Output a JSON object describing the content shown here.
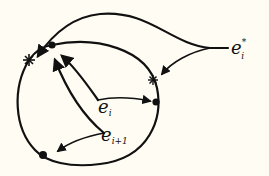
{
  "diagram": {
    "background": "#fffdf3",
    "ink": "#111111",
    "labels": {
      "e_i": {
        "base": "e",
        "sub": "i"
      },
      "e_i1": {
        "base": "e",
        "sub": "i+1"
      },
      "e_i_star": {
        "base": "e",
        "sub": "i",
        "sup": "*"
      }
    },
    "nodes": [
      {
        "type": "dot",
        "name": "top"
      },
      {
        "type": "dot",
        "name": "right"
      },
      {
        "type": "dot",
        "name": "bottom-left"
      },
      {
        "type": "star",
        "name": "left"
      },
      {
        "type": "star",
        "name": "right"
      }
    ]
  }
}
